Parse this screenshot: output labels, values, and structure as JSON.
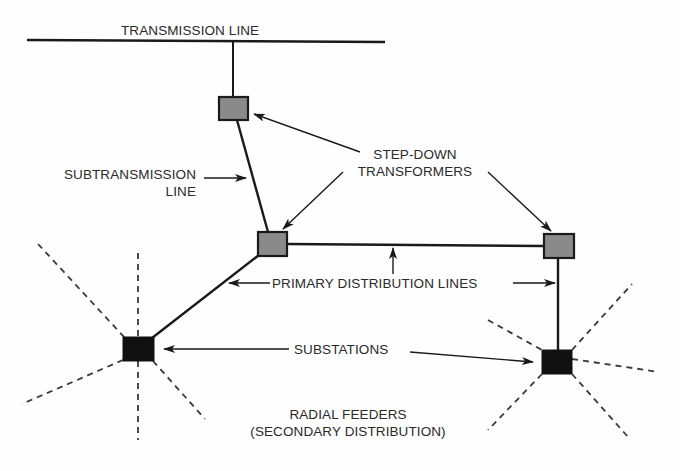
{
  "diagram": {
    "type": "power-distribution-network",
    "colors": {
      "line": "#1a1a1a",
      "transformer_fill": "#8a8a8a",
      "substation_fill": "#111111",
      "dashed": "#3a3a3a",
      "text": "#2a2a2a"
    },
    "labels": {
      "transmission_line": "TRANSMISSION LINE",
      "subtransmission_line_1": "SUBTRANSMISSION",
      "subtransmission_line_2": "LINE",
      "step_down_1": "STEP-DOWN",
      "step_down_2": "TRANSFORMERS",
      "primary_distribution": "PRIMARY DISTRIBUTION LINES",
      "substations": "SUBSTATIONS",
      "radial_feeders_1": "RADIAL FEEDERS",
      "radial_feeders_2": "(SECONDARY DISTRIBUTION)"
    },
    "nodes": [
      {
        "id": "transformer-top",
        "kind": "step-down transformer",
        "x": 233,
        "y": 108
      },
      {
        "id": "transformer-middle",
        "kind": "step-down transformer",
        "x": 272,
        "y": 244
      },
      {
        "id": "transformer-right",
        "kind": "step-down transformer",
        "x": 559,
        "y": 245
      },
      {
        "id": "substation-left",
        "kind": "substation",
        "x": 138,
        "y": 349
      },
      {
        "id": "substation-right",
        "kind": "substation",
        "x": 557,
        "y": 362
      }
    ],
    "edges": [
      {
        "from": "transmission-line",
        "to": "transformer-top",
        "kind": "feed"
      },
      {
        "from": "transformer-top",
        "to": "transformer-middle",
        "kind": "subtransmission"
      },
      {
        "from": "transformer-middle",
        "to": "transformer-right",
        "kind": "primary distribution"
      },
      {
        "from": "transformer-middle",
        "to": "substation-left",
        "kind": "primary distribution"
      },
      {
        "from": "transformer-right",
        "to": "substation-right",
        "kind": "primary distribution"
      }
    ]
  }
}
